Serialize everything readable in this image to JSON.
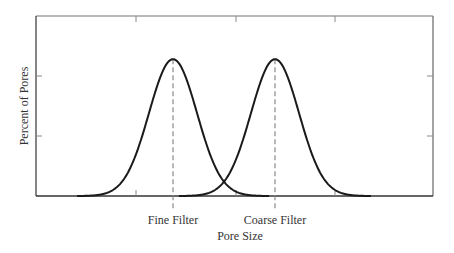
{
  "chart_data": {
    "type": "line",
    "title": "",
    "xlabel": "Pore Size",
    "ylabel": "Percent of Pores",
    "grid": false,
    "legend": null,
    "x_tick_labels": [],
    "y_tick_labels": [],
    "series": [
      {
        "name": "Fine Filter",
        "distribution": "normal",
        "mean_px": 173,
        "sd_px": 24,
        "peak_rel": 0.76
      },
      {
        "name": "Coarse Filter",
        "distribution": "normal",
        "mean_px": 275,
        "sd_px": 24,
        "peak_rel": 0.76
      }
    ],
    "annotations": [
      {
        "text": "Fine Filter",
        "type": "dashed-vertical-line",
        "at": "Fine Filter peak"
      },
      {
        "text": "Coarse Filter",
        "type": "dashed-vertical-line",
        "at": "Coarse Filter peak"
      }
    ],
    "frame": {
      "left": 36,
      "top": 16,
      "right": 433,
      "bottom": 196
    },
    "x_ticks_px": [
      136,
      236,
      335
    ],
    "y_ticks_px": [
      76,
      136
    ]
  },
  "labels": {
    "xlabel": "Pore Size",
    "ylabel": "Percent of Pores",
    "fine": "Fine Filter",
    "coarse": "Coarse Filter"
  },
  "colors": {
    "curve": "#1a1a1a",
    "frame": "#555555",
    "dash": "#8a8a8a"
  }
}
